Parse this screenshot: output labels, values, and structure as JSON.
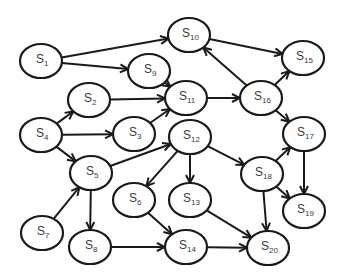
{
  "diagram": {
    "type": "directed-graph",
    "colors": {
      "stroke": "#1a1a1a",
      "text": "#3a3a3a",
      "background": "#ffffff"
    },
    "nodes": [
      {
        "id": "S1",
        "base": "S",
        "sub": "1",
        "x": 41,
        "y": 61,
        "rx": 21,
        "ry": 17
      },
      {
        "id": "S2",
        "base": "S",
        "sub": "2",
        "x": 89,
        "y": 100,
        "rx": 21,
        "ry": 17
      },
      {
        "id": "S3",
        "base": "S",
        "sub": "3",
        "x": 134,
        "y": 134,
        "rx": 21,
        "ry": 17
      },
      {
        "id": "S4",
        "base": "S",
        "sub": "4",
        "x": 41,
        "y": 135,
        "rx": 21,
        "ry": 17
      },
      {
        "id": "S5",
        "base": "S",
        "sub": "5",
        "x": 91,
        "y": 173,
        "rx": 21,
        "ry": 17
      },
      {
        "id": "S6",
        "base": "S",
        "sub": "6",
        "x": 134,
        "y": 200,
        "rx": 21,
        "ry": 17
      },
      {
        "id": "S7",
        "base": "S",
        "sub": "7",
        "x": 42,
        "y": 233,
        "rx": 21,
        "ry": 17
      },
      {
        "id": "S8",
        "base": "S",
        "sub": "8",
        "x": 90,
        "y": 247,
        "rx": 21,
        "ry": 17
      },
      {
        "id": "S9",
        "base": "S",
        "sub": "9",
        "x": 149,
        "y": 71,
        "rx": 21,
        "ry": 17
      },
      {
        "id": "S10",
        "base": "S",
        "sub": "10",
        "x": 189,
        "y": 35,
        "rx": 21,
        "ry": 17
      },
      {
        "id": "S11",
        "base": "S",
        "sub": "11",
        "x": 186,
        "y": 98,
        "rx": 21,
        "ry": 17
      },
      {
        "id": "S12",
        "base": "S",
        "sub": "12",
        "x": 190,
        "y": 137,
        "rx": 21,
        "ry": 17
      },
      {
        "id": "S13",
        "base": "S",
        "sub": "13",
        "x": 190,
        "y": 200,
        "rx": 21,
        "ry": 17
      },
      {
        "id": "S14",
        "base": "S",
        "sub": "14",
        "x": 186,
        "y": 247,
        "rx": 21,
        "ry": 17
      },
      {
        "id": "S15",
        "base": "S",
        "sub": "15",
        "x": 303,
        "y": 58,
        "rx": 21,
        "ry": 17
      },
      {
        "id": "S16",
        "base": "S",
        "sub": "16",
        "x": 261,
        "y": 98,
        "rx": 21,
        "ry": 17
      },
      {
        "id": "S17",
        "base": "S",
        "sub": "17",
        "x": 304,
        "y": 134,
        "rx": 21,
        "ry": 17
      },
      {
        "id": "S18",
        "base": "S",
        "sub": "18",
        "x": 262,
        "y": 174,
        "rx": 21,
        "ry": 17
      },
      {
        "id": "S19",
        "base": "S",
        "sub": "19",
        "x": 304,
        "y": 211,
        "rx": 21,
        "ry": 17
      },
      {
        "id": "S20",
        "base": "S",
        "sub": "20",
        "x": 268,
        "y": 248,
        "rx": 21,
        "ry": 17
      }
    ],
    "edges": [
      {
        "from": "S1",
        "to": "S10"
      },
      {
        "from": "S1",
        "to": "S9"
      },
      {
        "from": "S9",
        "to": "S11"
      },
      {
        "from": "S2",
        "to": "S11"
      },
      {
        "from": "S3",
        "to": "S11"
      },
      {
        "from": "S4",
        "to": "S2"
      },
      {
        "from": "S4",
        "to": "S3"
      },
      {
        "from": "S4",
        "to": "S5"
      },
      {
        "from": "S5",
        "to": "S12"
      },
      {
        "from": "S5",
        "to": "S8"
      },
      {
        "from": "S7",
        "to": "S5"
      },
      {
        "from": "S8",
        "to": "S14"
      },
      {
        "from": "S6",
        "to": "S14"
      },
      {
        "from": "S12",
        "to": "S6"
      },
      {
        "from": "S12",
        "to": "S13"
      },
      {
        "from": "S12",
        "to": "S18"
      },
      {
        "from": "S13",
        "to": "S20"
      },
      {
        "from": "S14",
        "to": "S20"
      },
      {
        "from": "S11",
        "to": "S16"
      },
      {
        "from": "S16",
        "to": "S10"
      },
      {
        "from": "S10",
        "to": "S15"
      },
      {
        "from": "S16",
        "to": "S15"
      },
      {
        "from": "S16",
        "to": "S17"
      },
      {
        "from": "S18",
        "to": "S17"
      },
      {
        "from": "S18",
        "to": "S19"
      },
      {
        "from": "S17",
        "to": "S19"
      },
      {
        "from": "S18",
        "to": "S20"
      }
    ]
  }
}
